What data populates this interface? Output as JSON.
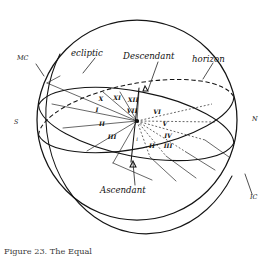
{
  "figure": {
    "caption": "Figure 23. The Equal",
    "background_color": "#ffffff",
    "ink_color": "#141414"
  },
  "labels": {
    "ecliptic": "ecliptic",
    "horizon": "horizon",
    "descendant": "Descendant",
    "ascendant": "Ascendant"
  },
  "cardinal_points": {
    "mc": "MC",
    "ic": "IC",
    "south": "S",
    "north": "N"
  },
  "house_numerals": {
    "upper_left_group": [
      "X",
      "XI",
      "XII"
    ],
    "left_group": [
      "I",
      "II",
      "III"
    ],
    "top_center": "VII",
    "right_group": [
      "VI",
      "V",
      "IV"
    ],
    "lower_right_group": [
      "II",
      "III"
    ],
    "center_small": "i"
  },
  "numerals": [
    {
      "text": "X",
      "x": 101,
      "y": 101
    },
    {
      "text": "XI",
      "x": 117,
      "y": 100
    },
    {
      "text": "XII",
      "x": 133,
      "y": 102
    },
    {
      "text": "I",
      "x": 97,
      "y": 112
    },
    {
      "text": "II",
      "x": 102,
      "y": 126
    },
    {
      "text": "III",
      "x": 112,
      "y": 139
    },
    {
      "text": "VII",
      "x": 132,
      "y": 113
    },
    {
      "text": "VI",
      "x": 157,
      "y": 114
    },
    {
      "text": "V",
      "x": 165,
      "y": 126
    },
    {
      "text": "IV",
      "x": 168,
      "y": 138
    },
    {
      "text": "II",
      "x": 152,
      "y": 148
    },
    {
      "text": "III",
      "x": 168,
      "y": 148
    },
    {
      "text": "i",
      "x": 137,
      "y": 141
    }
  ],
  "geometry": {
    "sphere_center_x": 137,
    "sphere_center_y": 120,
    "sphere_radius": 100,
    "origin_x": 137,
    "origin_y": 121
  },
  "line_styles": {
    "visible": "solid",
    "hidden_ecliptic": "dashed",
    "hidden_houses": "dotted"
  }
}
